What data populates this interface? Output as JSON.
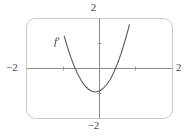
{
  "figure": {
    "title": "",
    "curve_label": "f′",
    "labels": {
      "top": "2",
      "bottom": "−2",
      "left": "−2",
      "right": "2"
    },
    "colors": {
      "background": "#ffffff",
      "frame": "#c9c9c9",
      "axis": "#8c8c8c",
      "curve": "#5a5a5a",
      "text": "#4a4a4a"
    }
  },
  "chart_data": {
    "type": "line",
    "title": "",
    "subtitle": "",
    "xlabel": "",
    "ylabel": "",
    "xlim": [
      -2,
      2
    ],
    "ylim": [
      -2,
      2
    ],
    "xticks": [
      -2,
      -1,
      0,
      1,
      2
    ],
    "yticks": [
      -2,
      -1,
      0,
      1,
      2
    ],
    "xtick_labels": [
      "−2",
      "",
      "",
      "",
      "2"
    ],
    "ytick_labels": [
      "−2",
      "",
      "",
      "",
      "2"
    ],
    "grid": false,
    "legend": null,
    "annotations": [
      {
        "text": "f′",
        "x": -1.15,
        "y": 1.0
      }
    ],
    "series": [
      {
        "name": "f′",
        "equation": "y = 3x^2 + 0.7x - 0.9",
        "vertex": [
          -0.12,
          -0.94
        ],
        "roots": [
          -0.67,
          0.44
        ],
        "x": [
          -0.98,
          -0.9,
          -0.8,
          -0.7,
          -0.6,
          -0.5,
          -0.4,
          -0.3,
          -0.2,
          -0.12,
          0.0,
          0.1,
          0.2,
          0.3,
          0.4,
          0.5,
          0.6,
          0.7,
          0.8,
          0.83
        ],
        "values": [
          1.29,
          0.9,
          0.46,
          0.08,
          -0.24,
          -0.5,
          -0.7,
          -0.84,
          -0.92,
          -0.94,
          -0.9,
          -0.8,
          -0.64,
          -0.44,
          -0.14,
          0.2,
          0.6,
          1.06,
          1.58,
          1.75
        ]
      }
    ]
  }
}
